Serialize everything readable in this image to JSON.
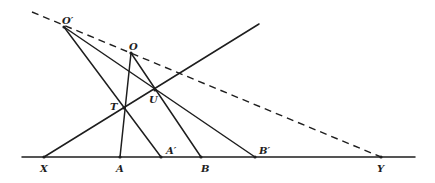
{
  "figure": {
    "type": "geometric-construction",
    "points": {
      "O_prime": {
        "label": "O′",
        "x": 64,
        "y": 27
      },
      "O": {
        "label": "O",
        "x": 131,
        "y": 53
      },
      "T": {
        "label": "T",
        "x": 124,
        "y": 108
      },
      "U": {
        "label": "U",
        "x": 155,
        "y": 90
      },
      "X": {
        "label": "X",
        "x": 44,
        "y": 157
      },
      "A": {
        "label": "A",
        "x": 120,
        "y": 157
      },
      "A_prime": {
        "label": "A′",
        "x": 161,
        "y": 157
      },
      "B": {
        "label": "B",
        "x": 201,
        "y": 157
      },
      "B_prime": {
        "label": "B′",
        "x": 255,
        "y": 157
      },
      "Y": {
        "label": "Y",
        "x": 381,
        "y": 157
      }
    },
    "baseline": {
      "x1": 22,
      "x2": 415,
      "y": 157
    },
    "dashed_line": {
      "x1": 32,
      "y1": 12,
      "x2": 381,
      "y2": 157
    },
    "transversal": {
      "x1": 44,
      "y1": 157,
      "x2": 259,
      "y2": 24
    }
  }
}
